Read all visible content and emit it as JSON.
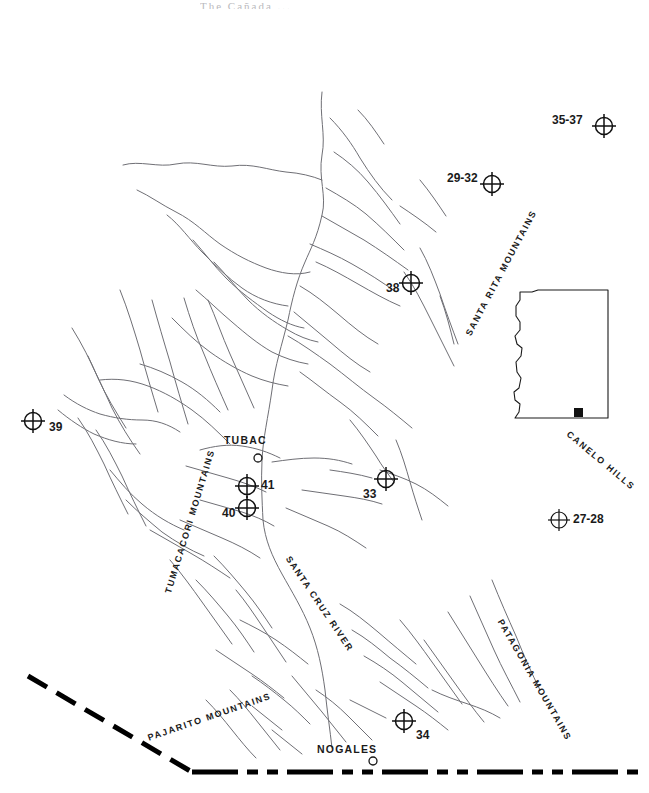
{
  "figure": {
    "kind": "line-drawing-map",
    "region": "Santa Cruz River valley, southern Arizona",
    "cropped_title": "The Cañada ... ",
    "background_color": "#ffffff",
    "ink_color": "#1a1a1a",
    "stream_color": "#6f6f75"
  },
  "site_markers": [
    {
      "label": "35-37",
      "x": 604,
      "y": 126,
      "label_side": "left",
      "label_x": 552,
      "label_y": 120
    },
    {
      "label": "29-32",
      "x": 492,
      "y": 184,
      "label_side": "left",
      "label_x": 447,
      "label_y": 178
    },
    {
      "label": "38",
      "x": 411,
      "y": 283,
      "label_side": "left",
      "label_x": 386,
      "label_y": 288
    },
    {
      "label": "39",
      "x": 33,
      "y": 421,
      "label_side": "right",
      "label_x": 49,
      "label_y": 427
    },
    {
      "label": "33",
      "x": 386,
      "y": 479,
      "label_side": "left",
      "label_x": 363,
      "label_y": 494
    },
    {
      "label": "41",
      "x": 247,
      "y": 486,
      "label_side": "right",
      "label_x": 261,
      "label_y": 485
    },
    {
      "label": "40",
      "x": 247,
      "y": 508,
      "label_side": "left",
      "label_x": 222,
      "label_y": 513
    },
    {
      "label": "34",
      "x": 404,
      "y": 721,
      "label_side": "right",
      "label_x": 416,
      "label_y": 735
    },
    {
      "label": "27-28",
      "x": 559,
      "y": 520,
      "label_side": "right",
      "label_x": 573,
      "label_y": 520
    }
  ],
  "towns": [
    {
      "name": "TUBAC",
      "dot_x": 258,
      "dot_y": 458,
      "label_x": 224,
      "label_y": 440
    },
    {
      "name": "NOGALES",
      "dot_x": 373,
      "dot_y": 761,
      "label_x": 317,
      "label_y": 749
    }
  ],
  "range_labels": [
    {
      "text": "SANTA RITA MOUNTAINS",
      "x": 468,
      "y": 330,
      "rotate": -62
    },
    {
      "text": "TUMACACORI MOUNTAINS",
      "x": 168,
      "y": 588,
      "rotate": -73
    },
    {
      "text": "SANTA CRUZ RIVER",
      "x": 288,
      "y": 552,
      "rotate": 56
    },
    {
      "text": "PATAGONIA MOUNTAINS",
      "x": 500,
      "y": 615,
      "rotate": 60
    },
    {
      "text": "PAJARITO MOUNTAINS",
      "x": 148,
      "y": 733,
      "rotate": -19
    },
    {
      "text": "CANELO HILLS",
      "x": 568,
      "y": 428,
      "rotate": 40
    }
  ],
  "inset": {
    "name": "Arizona state outline",
    "site_dot": {
      "x": 578,
      "y": 412
    },
    "outline_color": "#1a1a1a"
  },
  "border": {
    "name": "international-border",
    "style": "dash-dot",
    "color": "#000000",
    "description": "thick dashed line running from upper-left down to lower-right then horizontal"
  },
  "symbols": {
    "site_marker": "crosshair-circle-icon",
    "town_marker": "small-open-circle-icon",
    "inset_site": "filled-square-icon"
  }
}
